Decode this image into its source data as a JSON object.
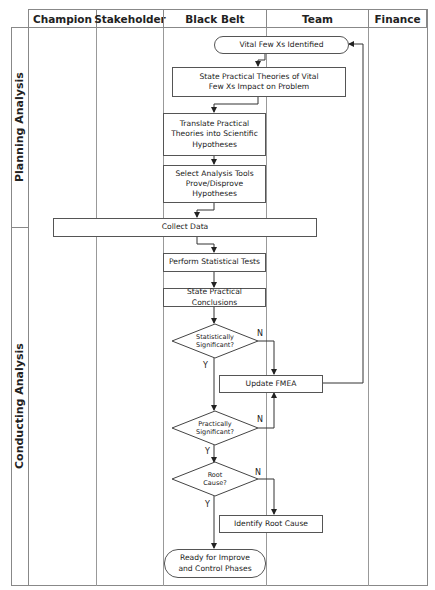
{
  "columns": [
    "Champion",
    "Stakeholder",
    "Black Belt",
    "Team",
    "Finance"
  ],
  "lanes": [
    "Planning Analysis",
    "Conducting Analysis"
  ],
  "nodes": {
    "vital_few": "Vital Few Xs Identified",
    "state_theories": "State Practical Theories of Vital Few Xs Impact on Problem",
    "translate": "Translate Practical Theories into Scientific Hypotheses",
    "select_tools": "Select Analysis Tools Prove/Disprove Hypotheses",
    "collect_data": "Collect Data",
    "perform_tests": "Perform Statistical Tests",
    "state_conclusions": "State Practical Conclusions",
    "stat_sig": "Statistically Significant?",
    "update_fmea": "Update FMEA",
    "prac_sig": "Practically Significant?",
    "root_cause": "Root Cause?",
    "identify_root": "Identify Root Cause",
    "ready": "Ready for Improve and Control Phases"
  },
  "labels": {
    "yes": "Y",
    "no": "N"
  }
}
